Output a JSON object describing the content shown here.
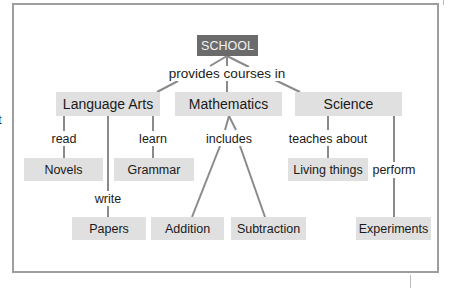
{
  "diagram": {
    "type": "concept-map",
    "root": {
      "label": "SCHOOL"
    },
    "root_link_label": "provides courses in",
    "subjects": [
      {
        "label": "Language Arts"
      },
      {
        "label": "Mathematics"
      },
      {
        "label": "Science"
      }
    ],
    "leaves": {
      "novels": "Novels",
      "grammar": "Grammar",
      "papers": "Papers",
      "addition": "Addition",
      "subtraction": "Subtraction",
      "living_things": "Living things",
      "experiments": "Experiments"
    },
    "link_labels": {
      "read": "read",
      "learn": "learn",
      "write": "write",
      "includes": "includes",
      "teaches_about": "teaches about",
      "perform": "perform"
    },
    "edge_text_fragment": "t",
    "colors": {
      "root_fill": "#6b6b6b",
      "node_fill": "#e0e0e0",
      "line": "#8a8a8a",
      "frame": "#9e9e9e"
    }
  }
}
